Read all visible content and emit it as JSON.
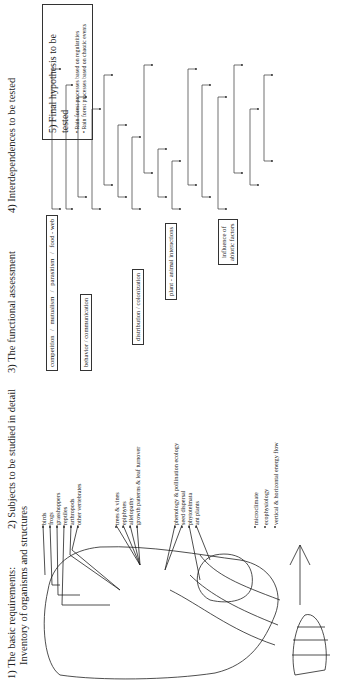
{
  "headings": {
    "h1_line1": "1)  The basic requirements:",
    "h1_line2": "Inventory of organisms and structures",
    "h2": "2) Subjects to be studied in detail",
    "h3": "3) The functional assessment",
    "h4": "4) Interdependences to be tested"
  },
  "hypothesis": {
    "title": "5) Final hypothesis to be tested",
    "items": [
      "Rain forest processes based on regularities",
      "Rain forest processes based on chaotic events"
    ]
  },
  "subjects": {
    "animals": [
      "birds",
      "frogs",
      "grasshoppers",
      "reptiles",
      "arthropods",
      "other vertebrates"
    ],
    "plants": [
      "trees & vines",
      "epiphytes",
      "allelopathy",
      "growth patterns & leaf turnover"
    ],
    "interactions": [
      "phenology & pollination ecology",
      "seed dispersal",
      "phytotelmata",
      "ant plants"
    ],
    "abiotic": [
      "microclimate",
      "ecophysiology",
      "vertical & horizontal energy flow"
    ]
  },
  "functional": {
    "row1": [
      "competition",
      "/",
      "mutualism",
      "/",
      "parasitism",
      "/",
      "food - web"
    ],
    "behavior": "behavior / communication",
    "distribution": "distribution / colonization",
    "plant_animal": "plant - animal interactions",
    "abiotic_line1": "influence of",
    "abiotic_line2": "abiotic factors"
  },
  "colors": {
    "ink": "#1a1a1a",
    "background": "#ffffff"
  }
}
